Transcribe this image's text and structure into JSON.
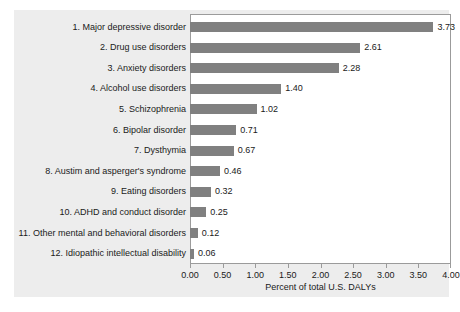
{
  "chart_data": {
    "type": "bar",
    "orientation": "horizontal",
    "title": "",
    "xlabel": "Percent of total U.S. DALYs",
    "ylabel": "",
    "xlim": [
      0.0,
      4.0
    ],
    "xticks": [
      "0.00",
      "0.50",
      "1.00",
      "1.50",
      "2.00",
      "2.50",
      "3.00",
      "3.50",
      "4.00"
    ],
    "xtick_values": [
      0.0,
      0.5,
      1.0,
      1.5,
      2.0,
      2.5,
      3.0,
      3.5,
      4.0
    ],
    "grid": false,
    "legend": false,
    "bar_color": "#808080",
    "plot_background": "#ffffff",
    "figure_background": "#ededed",
    "categories": [
      "1. Major depressive disorder",
      "2. Drug use disorders",
      "3. Anxiety disorders",
      "4. Alcohol use disorders",
      "5. Schizophrenia",
      "6. Bipolar disorder",
      "7. Dysthymia",
      "8. Austim and asperger's syndrome",
      "9. Eating disorders",
      "10. ADHD and conduct disorder",
      "11. Other mental and behavioral disorders",
      "12. Idiopathic intellectual disability"
    ],
    "values": [
      3.73,
      2.61,
      2.28,
      1.4,
      1.02,
      0.71,
      0.67,
      0.46,
      0.32,
      0.25,
      0.12,
      0.06
    ],
    "value_labels": [
      "3.73",
      "2.61",
      "2.28",
      "1.40",
      "1.02",
      "0.71",
      "0.67",
      "0.46",
      "0.32",
      "0.25",
      "0.12",
      "0.06"
    ]
  }
}
